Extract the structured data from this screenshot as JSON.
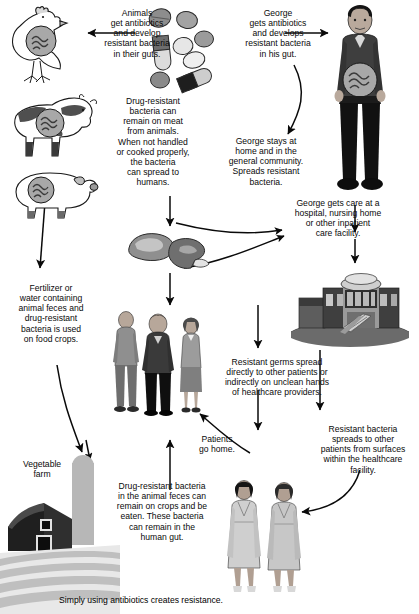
{
  "diagram": {
    "footer_caption": "Simply using antibiotics creates resistance.",
    "colors": {
      "ink": "#0a0a0a",
      "line": "#1a1a1a",
      "gray_dark": "#4a4a4a",
      "gray_mid": "#8c8c8c",
      "gray_light": "#c9c9c9",
      "barn_dark": "#3b3b3b",
      "field": "#bdbdbd",
      "paper": "#ffffff"
    }
  },
  "labels": {
    "animals_antibiotics": "Animals\nget antibiotics\nand develop\nresistant bacteria\nin their guts.",
    "george_antibiotics": "George\ngets antibiotics\nand develops\nresistant bacteria\nin his gut.",
    "meat_bacteria": "Drug-resistant\nbacteria can\nremain on meat\nfrom animals.\nWhen not handled\nor cooked properly,\nthe bacteria\ncan spread to\nhumans.",
    "george_home": "George stays at\nhome and in the\ngeneral community.\nSpreads resistant\nbacteria.",
    "george_care": "George gets care at a\nhospital, nursing home\nor other inpatient\ncare facility.",
    "fertilizer": "Fertilizer or\nwater containing\nanimal feces and\ndrug-resistant\nbacteria is used\non food crops.",
    "resistant_germs_spread": "Resistant germs spread\ndirectly to other patients or\nindirectly on unclean hands\nof healthcare providers.",
    "patients_go_home": "Patients\ngo home.",
    "surfaces_spread": "Resistant bacteria\nspreads to other\npatients from surfaces\nwithin the healthcare\nfacility.",
    "vegetable_farm": "Vegetable\nfarm",
    "crops_bacteria": "Drug-resistant bacteria\nin the animal feces can\nremain on crops and be\neaten. These bacteria\ncan remain in the\nhuman gut.",
    "footer": "Simply using antibiotics creates resistance."
  },
  "figures": {
    "chicken": "chicken-with-gut-bacteria",
    "cow": "cow-with-gut-bacteria",
    "pig": "pig-with-gut-bacteria",
    "pills": "antibiotic-pills-cluster",
    "george": "george-standing-figure-with-gut-bacteria",
    "meat": "raw-meat-cuts",
    "community_people": "three-community-people",
    "hospital": "hospital-building",
    "patients": "two-patients-in-gowns",
    "farm": "vegetable-farm-barn-and-silo"
  },
  "arrows": {
    "pills_to_animals": "arrow-left-to-chicken",
    "pills_to_george": "arrow-right-to-george",
    "george_to_home": "curved-arrow-george-to-community",
    "animals_to_meat": "arrow-down-to-meat",
    "meat_to_people": "arrow-down-to-community-people",
    "animals_to_fertilizer": "arrow-down-left-to-fertilizer",
    "fertilizer_to_farm": "curved-arrow-to-vegetable-farm",
    "george_to_hospital": "arrow-down-to-hospital",
    "hospital_to_germs": "arrow-down-resistant-germs",
    "germs_to_people": "curved-arrow-patients-go-home",
    "hospital_to_surfaces": "arrow-down-to-patients",
    "surfaces_to_patients": "curved-arrow-to-patients",
    "crops_to_people": "arrow-up-from-crops"
  }
}
